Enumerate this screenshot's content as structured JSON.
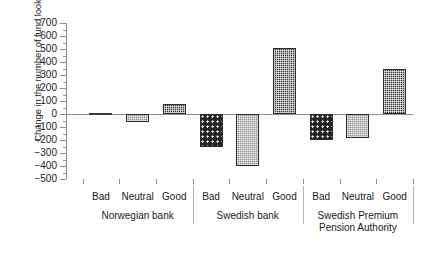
{
  "chart_data": {
    "type": "bar",
    "title": "",
    "subtitle": "",
    "xlabel": "",
    "ylabel": "Change in the number of fund look-ups",
    "ylim": [
      -500,
      700
    ],
    "ytick_step": 100,
    "ytick_labels": [
      "700",
      "600",
      "500",
      "400",
      "300",
      "200",
      "100",
      "0",
      "−100",
      "−200",
      "−300",
      "−400",
      "−500"
    ],
    "ytick_values": [
      700,
      600,
      500,
      400,
      300,
      200,
      100,
      0,
      -100,
      -200,
      -300,
      -400,
      -500
    ],
    "grid": false,
    "legend": false,
    "legend_position": "none",
    "categories": [
      "Bad",
      "Neutral",
      "Good"
    ],
    "groups": [
      {
        "name": "Norwegian bank",
        "bars": [
          {
            "category": "Bad",
            "value": 0,
            "fill": "bad"
          },
          {
            "category": "Neutral",
            "value": -60,
            "fill": "neutral"
          },
          {
            "category": "Good",
            "value": 75,
            "fill": "good"
          }
        ]
      },
      {
        "name": "Swedish bank",
        "bars": [
          {
            "category": "Bad",
            "value": -250,
            "fill": "bad"
          },
          {
            "category": "Neutral",
            "value": -400,
            "fill": "neutral"
          },
          {
            "category": "Good",
            "value": 510,
            "fill": "good"
          }
        ]
      },
      {
        "name": "Swedish Premium Pension Authority",
        "name_line1": "Swedish Premium",
        "name_line2": "Pension Authority",
        "bars": [
          {
            "category": "Bad",
            "value": -200,
            "fill": "bad"
          },
          {
            "category": "Neutral",
            "value": -185,
            "fill": "neutral"
          },
          {
            "category": "Good",
            "value": 350,
            "fill": "good"
          }
        ]
      }
    ],
    "colors": {
      "bar_edge": "#2c2c2c",
      "fill_bad": "#262626",
      "fill_neutral": "#8c8c8c",
      "fill_good": "#343434",
      "axis": "#8d8d8d",
      "text": "#1a1a1a",
      "background": "#ffffff"
    }
  }
}
